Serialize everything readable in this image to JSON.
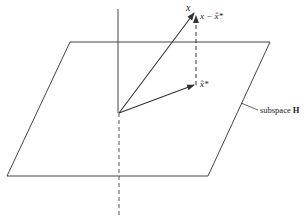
{
  "diagram": {
    "labels": {
      "x": "x",
      "x_minus_xhat": "x − x̂*",
      "xhat": "x̂*",
      "subspace_prefix": "subspace ",
      "subspace_name": "H"
    },
    "colors": {
      "stroke": "#333333",
      "background": "#ffffff"
    },
    "elements": [
      "plane parallelogram (subspace H)",
      "vertical axis (solid above plane, dashed below)",
      "vector x from origin",
      "projection x̂* in plane",
      "dashed error vector x − x̂*",
      "leader line to subspace label"
    ]
  }
}
